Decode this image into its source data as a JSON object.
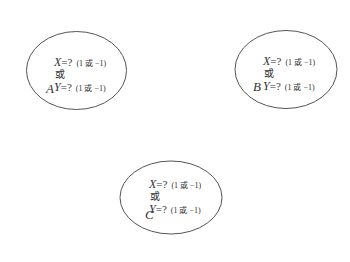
{
  "nodes": [
    {
      "label": "A",
      "x_var": "X",
      "y_var": "Y",
      "eq": "=?",
      "hint": "(1 或 −1)",
      "or": "或"
    },
    {
      "label": "B",
      "x_var": "X",
      "y_var": "Y",
      "eq": "=?",
      "hint": "(1 或 −1)",
      "or": "或"
    },
    {
      "label": "C",
      "x_var": "X",
      "y_var": "Y",
      "eq": "=?",
      "hint": "(1 或 −1)",
      "or": "或"
    }
  ],
  "colors": {
    "stroke": "#555555",
    "text": "#333333",
    "background": "#ffffff"
  }
}
